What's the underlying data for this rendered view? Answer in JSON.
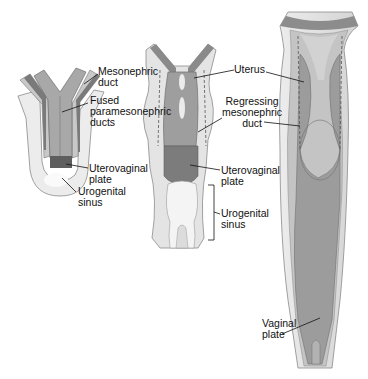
{
  "colors": {
    "outer_mesenchyme": "#e4e4e4",
    "outer_mesenchyme_stroke": "#8a8a8a",
    "mid_tissue": "#b8b8b8",
    "duct_dark": "#888888",
    "duct_darker": "#6f6f6f",
    "sinus_light": "#f0f0f0",
    "leader_line": "#111111",
    "dashed_line": "#555555"
  },
  "stages": [
    {
      "id": "early",
      "labels": [
        {
          "text": "Mesonephric\nduct"
        },
        {
          "text": "Fused\nparamesonephric\nducts"
        },
        {
          "text": "Uterovaginal\nplate"
        },
        {
          "text": "Urogenital\nsinus"
        }
      ]
    },
    {
      "id": "middle",
      "labels": [
        {
          "text": "Uterus"
        },
        {
          "text": "Regressing\nmesonephric\nduct"
        },
        {
          "text": "Uterovaginal\nplate"
        },
        {
          "text": "Urogenital\nsinus"
        }
      ]
    },
    {
      "id": "late",
      "labels": [
        {
          "text": "Vaginal\nplate"
        }
      ]
    }
  ]
}
